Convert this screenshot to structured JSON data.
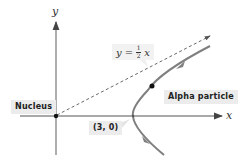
{
  "diagram": {
    "axes": {
      "x_label": "x",
      "y_label": "y"
    },
    "asymptote": {
      "equation_lhs": "y =",
      "fraction_numerator": "1",
      "fraction_denominator": "2",
      "equation_rhs": "x",
      "style": "dashed"
    },
    "labels": {
      "nucleus": "Nucleus",
      "alpha_particle": "Alpha particle",
      "vertex": "(3, 0)"
    },
    "colors": {
      "axis": "#555555",
      "curve": "#7f7f7f",
      "asymptote": "#555555",
      "dot": "#111111",
      "label_bg": "#ececec"
    },
    "points": {
      "nucleus": {
        "x": 0,
        "y": 0
      },
      "vertex": {
        "x": 3,
        "y": 0
      }
    }
  }
}
